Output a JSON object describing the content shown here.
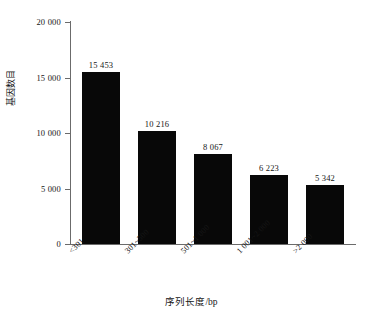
{
  "chart_data": {
    "type": "bar",
    "title": "",
    "xlabel": "序列长度/bp",
    "ylabel": "基因数目",
    "categories": [
      "<301",
      "301~500",
      "501~1 000",
      "1 001~2 000",
      ">2 000"
    ],
    "values": [
      15453,
      10216,
      8067,
      6223,
      5342
    ],
    "value_labels": [
      "15 453",
      "10 216",
      "8 067",
      "6 223",
      "5 342"
    ],
    "ylim": [
      0,
      20000
    ],
    "ytick_values": [
      0,
      5000,
      10000,
      15000,
      20000
    ],
    "ytick_labels": [
      "0",
      "5 000",
      "10 000",
      "15 000",
      "20 000"
    ],
    "grid": false,
    "legend": false,
    "bar_color": "#080808",
    "axis_color": "#6b6b6b",
    "background_color": "#ffffff"
  }
}
